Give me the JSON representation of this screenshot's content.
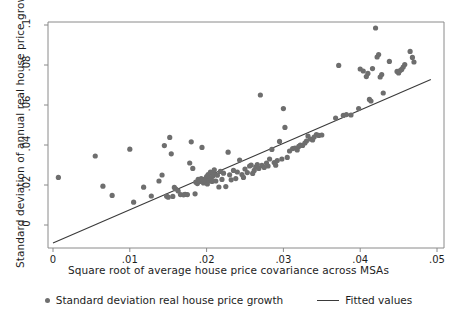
{
  "chart_data": {
    "type": "scatter",
    "title": "",
    "xlabel": "Square root of average house price covariance across MSAs",
    "ylabel": "Standard deviation of annual real house price growth",
    "xlim": [
      0,
      0.05
    ],
    "ylim": [
      -0.0115,
      0.1015
    ],
    "xticks": [
      0,
      0.01,
      0.02,
      0.03,
      0.04,
      0.05
    ],
    "xtick_labels": [
      "0",
      ".01",
      ".02",
      ".03",
      ".04",
      ".05"
    ],
    "yticks": [
      0,
      0.02,
      0.04,
      0.06,
      0.08,
      0.1
    ],
    "ytick_labels": [
      "0",
      ".02",
      ".04",
      ".06",
      ".08",
      ".1"
    ],
    "grid": false,
    "legend_position": "bottom",
    "marker_color": "#6e6e6e",
    "line_color": "#3a3a3a",
    "axis_color": "#8a8a8a",
    "series": [
      {
        "name": "Standard deviation real house price growth",
        "type": "scatter",
        "points": [
          [
            0.0007,
            0.0238
          ],
          [
            0.0055,
            0.0345
          ],
          [
            0.0065,
            0.0194
          ],
          [
            0.0077,
            0.0148
          ],
          [
            0.01,
            0.0379
          ],
          [
            0.0105,
            0.0114
          ],
          [
            0.0118,
            0.0189
          ],
          [
            0.0128,
            0.0145
          ],
          [
            0.0138,
            0.022
          ],
          [
            0.0142,
            0.025
          ],
          [
            0.0145,
            0.0397
          ],
          [
            0.0148,
            0.0144
          ],
          [
            0.015,
            0.0139
          ],
          [
            0.0152,
            0.0438
          ],
          [
            0.0154,
            0.0356
          ],
          [
            0.0156,
            0.0143
          ],
          [
            0.0158,
            0.0188
          ],
          [
            0.016,
            0.018
          ],
          [
            0.0163,
            0.017
          ],
          [
            0.0166,
            0.0152
          ],
          [
            0.017,
            0.0151
          ],
          [
            0.0172,
            0.0153
          ],
          [
            0.0175,
            0.0152
          ],
          [
            0.0178,
            0.031
          ],
          [
            0.018,
            0.0416
          ],
          [
            0.0182,
            0.0283
          ],
          [
            0.0185,
            0.0156
          ],
          [
            0.0186,
            0.0214
          ],
          [
            0.0188,
            0.0207
          ],
          [
            0.0189,
            0.0228
          ],
          [
            0.0191,
            0.0218
          ],
          [
            0.0193,
            0.0232
          ],
          [
            0.0194,
            0.0388
          ],
          [
            0.0196,
            0.021
          ],
          [
            0.0197,
            0.0224
          ],
          [
            0.0198,
            0.023
          ],
          [
            0.0199,
            0.0216
          ],
          [
            0.02,
            0.0242
          ],
          [
            0.0201,
            0.0205
          ],
          [
            0.0202,
            0.0252
          ],
          [
            0.0203,
            0.0222
          ],
          [
            0.0204,
            0.0235
          ],
          [
            0.0205,
            0.0265
          ],
          [
            0.0206,
            0.0228
          ],
          [
            0.0207,
            0.0218
          ],
          [
            0.0208,
            0.0244
          ],
          [
            0.0209,
            0.0258
          ],
          [
            0.021,
            0.0276
          ],
          [
            0.0212,
            0.022
          ],
          [
            0.0214,
            0.0249
          ],
          [
            0.0216,
            0.019
          ],
          [
            0.0218,
            0.0268
          ],
          [
            0.022,
            0.0228
          ],
          [
            0.0222,
            0.0259
          ],
          [
            0.0225,
            0.0192
          ],
          [
            0.0228,
            0.0364
          ],
          [
            0.023,
            0.0251
          ],
          [
            0.0232,
            0.0226
          ],
          [
            0.0235,
            0.0273
          ],
          [
            0.0238,
            0.0232
          ],
          [
            0.024,
            0.0265
          ],
          [
            0.0243,
            0.0325
          ],
          [
            0.0246,
            0.0252
          ],
          [
            0.0248,
            0.0238
          ],
          [
            0.025,
            0.028
          ],
          [
            0.0253,
            0.0262
          ],
          [
            0.0256,
            0.0295
          ],
          [
            0.0258,
            0.03
          ],
          [
            0.026,
            0.0258
          ],
          [
            0.0262,
            0.0273
          ],
          [
            0.0264,
            0.029
          ],
          [
            0.0266,
            0.0302
          ],
          [
            0.0268,
            0.0283
          ],
          [
            0.027,
            0.065
          ],
          [
            0.0272,
            0.0298
          ],
          [
            0.0275,
            0.0288
          ],
          [
            0.0278,
            0.031
          ],
          [
            0.028,
            0.0295
          ],
          [
            0.0282,
            0.033
          ],
          [
            0.0285,
            0.0378
          ],
          [
            0.0288,
            0.0312
          ],
          [
            0.029,
            0.0299
          ],
          [
            0.0292,
            0.0322
          ],
          [
            0.0295,
            0.0418
          ],
          [
            0.0298,
            0.033
          ],
          [
            0.03,
            0.0582
          ],
          [
            0.0302,
            0.0488
          ],
          [
            0.0305,
            0.0338
          ],
          [
            0.0308,
            0.037
          ],
          [
            0.0312,
            0.0382
          ],
          [
            0.0315,
            0.0385
          ],
          [
            0.0318,
            0.0375
          ],
          [
            0.032,
            0.0393
          ],
          [
            0.0322,
            0.04
          ],
          [
            0.0325,
            0.0398
          ],
          [
            0.0328,
            0.041
          ],
          [
            0.033,
            0.042
          ],
          [
            0.0332,
            0.0445
          ],
          [
            0.0335,
            0.043
          ],
          [
            0.0338,
            0.0425
          ],
          [
            0.034,
            0.044
          ],
          [
            0.0343,
            0.0452
          ],
          [
            0.0346,
            0.0448
          ],
          [
            0.035,
            0.045
          ],
          [
            0.0368,
            0.0535
          ],
          [
            0.0372,
            0.0798
          ],
          [
            0.0378,
            0.0548
          ],
          [
            0.0382,
            0.0552
          ],
          [
            0.0388,
            0.055
          ],
          [
            0.0398,
            0.0582
          ],
          [
            0.04,
            0.078
          ],
          [
            0.0404,
            0.077
          ],
          [
            0.0408,
            0.0742
          ],
          [
            0.041,
            0.0758
          ],
          [
            0.0412,
            0.0628
          ],
          [
            0.0414,
            0.062
          ],
          [
            0.0416,
            0.0782
          ],
          [
            0.042,
            0.0985
          ],
          [
            0.0422,
            0.084
          ],
          [
            0.0424,
            0.0852
          ],
          [
            0.0426,
            0.074
          ],
          [
            0.0428,
            0.0752
          ],
          [
            0.043,
            0.066
          ],
          [
            0.0438,
            0.0818
          ],
          [
            0.0448,
            0.0768
          ],
          [
            0.045,
            0.076
          ],
          [
            0.0452,
            0.0772
          ],
          [
            0.0454,
            0.0778
          ],
          [
            0.0456,
            0.079
          ],
          [
            0.0458,
            0.0802
          ],
          [
            0.0465,
            0.0868
          ],
          [
            0.0468,
            0.0838
          ],
          [
            0.047,
            0.0815
          ]
        ]
      },
      {
        "name": "Fitted values",
        "type": "line",
        "points": [
          [
            0.0,
            -0.009
          ],
          [
            0.0492,
            0.0727
          ]
        ]
      }
    ]
  },
  "legend": {
    "entries": [
      {
        "label": "Standard deviation real house price growth",
        "marker": "dot-marker"
      },
      {
        "label": "Fitted values",
        "marker": "line-marker"
      }
    ]
  }
}
